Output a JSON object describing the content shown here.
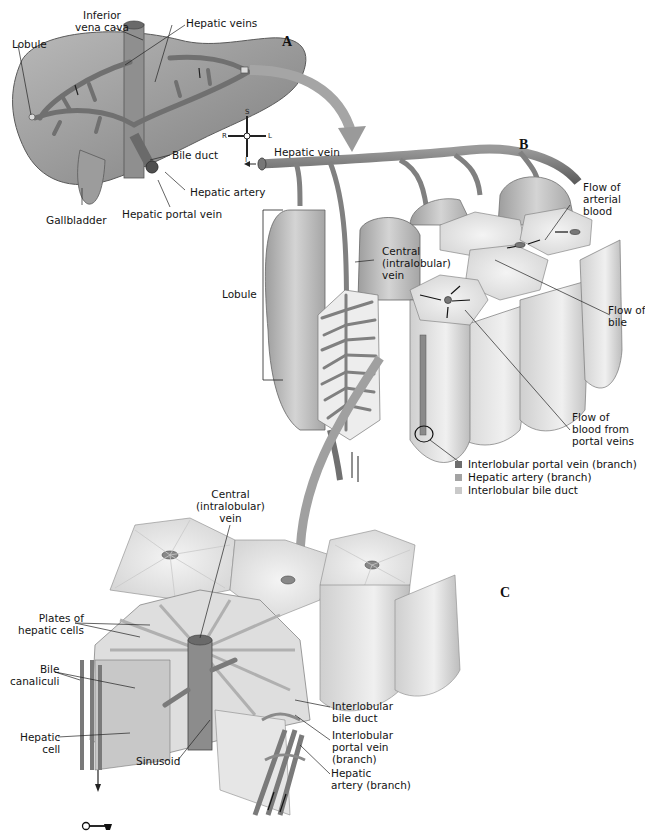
{
  "figure": {
    "panels": {
      "a": "A",
      "b": "B",
      "c": "C"
    },
    "compass": {
      "superior": "S",
      "inferior": "I",
      "right": "R",
      "left": "L"
    },
    "panel_a": {
      "labels": {
        "inferior_vena_cava": [
          "Inferior",
          "vena cava"
        ],
        "hepatic_veins": "Hepatic veins",
        "lobule": "Lobule",
        "bile_duct": "Bile duct",
        "hepatic_artery": "Hepatic artery",
        "hepatic_portal_vein": "Hepatic portal vein",
        "gallbladder": "Gallbladder"
      }
    },
    "panel_b": {
      "labels": {
        "hepatic_vein": "Hepatic vein",
        "lobule": "Lobule",
        "central_vein": [
          "Central",
          "(intralobular)",
          "vein"
        ],
        "flow_arterial": [
          "Flow of",
          "arterial",
          "blood"
        ],
        "flow_bile": [
          "Flow of",
          "bile"
        ],
        "flow_portal": [
          "Flow of",
          "blood from",
          "portal veins"
        ]
      },
      "legend": [
        {
          "label": "Interlobular portal vein (branch)",
          "color": "#6e6e6e"
        },
        {
          "label": "Hepatic artery (branch)",
          "color": "#a3a3a3"
        },
        {
          "label": "Interlobular bile duct",
          "color": "#c9c9c9"
        }
      ]
    },
    "panel_c": {
      "labels": {
        "central_vein": [
          "Central",
          "(intralobular)",
          "vein"
        ],
        "plates": [
          "Plates of",
          "hepatic cells"
        ],
        "bile_canaliculi": [
          "Bile",
          "canaliculi"
        ],
        "hepatic_cell": [
          "Hepatic",
          "cell"
        ],
        "sinusoid": "Sinusoid",
        "interlobular_bile_duct": [
          "Interlobular",
          "bile duct"
        ],
        "interlobular_portal_vein": [
          "Interlobular",
          "portal vein",
          "(branch)"
        ],
        "hepatic_artery_branch": [
          "Hepatic",
          "artery (branch)"
        ]
      }
    },
    "colors": {
      "tissue_dark": "#8a8a8a",
      "tissue_mid": "#b5b5b5",
      "tissue_light": "#e2e2e2",
      "vessel": "#6f6f6f",
      "arrow_band": "#9a9a9a"
    }
  }
}
